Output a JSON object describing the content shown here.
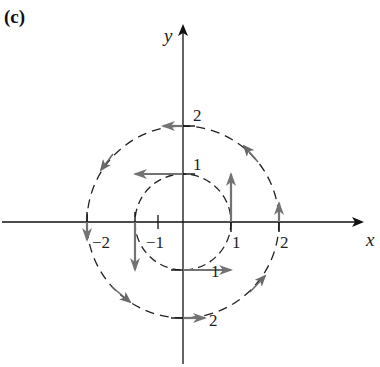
{
  "panel_label": "(c)",
  "axes": {
    "x_label": "x",
    "y_label": "y",
    "origin_px": [
      183,
      222
    ],
    "unit_px": 48
  },
  "tick_labels": {
    "x_pos_1": "1",
    "x_pos_2": "2",
    "x_neg_1": "−1",
    "x_neg_2": "−2",
    "y_pos_1": "1",
    "y_pos_2": "2",
    "y_neg_1": "1",
    "y_neg_2": "2"
  },
  "circles": [
    {
      "name": "inner",
      "radius": 1,
      "style": "dashed"
    },
    {
      "name": "outer",
      "radius": 2,
      "style": "dashed"
    }
  ],
  "vector_field": {
    "description": "F(x,y) = -y i + x j (counterclockwise rotation)",
    "color": "#737373",
    "vectors": [
      {
        "at": [
          1,
          0
        ],
        "dir": [
          0,
          1
        ],
        "length": 1
      },
      {
        "at": [
          0,
          1
        ],
        "dir": [
          -1,
          0
        ],
        "length": 1
      },
      {
        "at": [
          -1,
          0
        ],
        "dir": [
          0,
          -1
        ],
        "length": 1
      },
      {
        "at": [
          0,
          -1
        ],
        "dir": [
          1,
          0
        ],
        "length": 1
      },
      {
        "at": [
          0,
          2
        ],
        "dir": [
          -1,
          0
        ],
        "length": 0.5
      },
      {
        "at": [
          -2,
          0
        ],
        "dir": [
          0,
          -1
        ],
        "length": 0.3
      },
      {
        "at": [
          0,
          -2
        ],
        "dir": [
          1,
          0
        ],
        "length": 0.5
      },
      {
        "at": [
          2,
          0
        ],
        "dir": [
          0,
          1
        ],
        "length": 0.3
      }
    ]
  },
  "colors": {
    "axis": "#111111",
    "circle": "#222222",
    "vector": "#737373",
    "background": "#ffffff"
  }
}
